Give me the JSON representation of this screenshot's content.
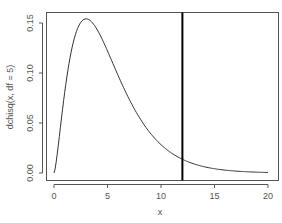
{
  "chart_data": {
    "type": "line",
    "title": "",
    "xlabel": "x",
    "ylabel": "dchisq(x, df = 5)",
    "xlim": [
      0,
      20
    ],
    "ylim": [
      0,
      0.154
    ],
    "x_ticks": [
      "0",
      "5",
      "10",
      "15",
      "20"
    ],
    "y_ticks": [
      "0.00",
      "0.05",
      "0.10",
      "0.15"
    ],
    "grid": false,
    "legend": null,
    "series": [
      {
        "name": "dchisq(x, df = 5)",
        "color": "#333333",
        "x": [
          0,
          0.5,
          1,
          1.5,
          2,
          2.5,
          3,
          3.5,
          4,
          4.5,
          5,
          6,
          7,
          8,
          9,
          10,
          11,
          12,
          13,
          14,
          15,
          16,
          17,
          18,
          19,
          20
        ],
        "values": [
          0,
          0.0366,
          0.0807,
          0.1156,
          0.1384,
          0.1504,
          0.1542,
          0.1519,
          0.1465,
          0.1377,
          0.1282,
          0.1069,
          0.0852,
          0.0661,
          0.0499,
          0.0376,
          0.0278,
          0.0204,
          0.0147,
          0.0106,
          0.0076,
          0.0054,
          0.0038,
          0.0026,
          0.0018,
          0.0012
        ]
      }
    ],
    "annotations": [
      {
        "type": "vline",
        "x": 12,
        "color": "#000000",
        "width": 2
      }
    ]
  }
}
